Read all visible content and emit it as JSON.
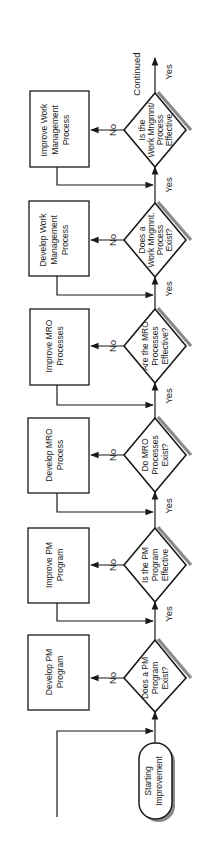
{
  "diagram": {
    "orientation": "rotated-90-ccw",
    "start": {
      "label_line1": "Starting",
      "label_line2": "Improvement"
    },
    "yes_label": "Yes",
    "no_label": "No",
    "continued_label": "Continued",
    "decisions": [
      {
        "id": "d1",
        "lines": [
          "Does a PM",
          "Program",
          "Exist?"
        ]
      },
      {
        "id": "d2",
        "lines": [
          "Is the PM",
          "Program",
          "Effective"
        ]
      },
      {
        "id": "d3",
        "lines": [
          "Do MRO",
          "Processes",
          "Exist?"
        ]
      },
      {
        "id": "d4",
        "lines": [
          "Are the MRO",
          "Processes",
          "Effective?"
        ]
      },
      {
        "id": "d5",
        "lines": [
          "Does a",
          "Work Mngmnt.",
          "Process",
          "Exist?"
        ]
      },
      {
        "id": "d6",
        "lines": [
          "Is the",
          "Work Mngmnt/",
          "Process",
          "Effective"
        ]
      }
    ],
    "actions": [
      {
        "id": "a1",
        "lines": [
          "Develop PM",
          "Program"
        ]
      },
      {
        "id": "a2",
        "lines": [
          "Improve PM",
          "Program"
        ]
      },
      {
        "id": "a3",
        "lines": [
          "Develop MRO",
          "Process"
        ]
      },
      {
        "id": "a4",
        "lines": [
          "Improve MRO",
          "Processes"
        ]
      },
      {
        "id": "a5",
        "lines": [
          "Develop Work",
          "Management",
          "Process"
        ]
      },
      {
        "id": "a6",
        "lines": [
          "Improve Work",
          "Management",
          "Process"
        ]
      }
    ],
    "colors": {
      "stroke": "#1a1a1a",
      "shadow": "#8a8a8a",
      "background": "#ffffff"
    }
  }
}
